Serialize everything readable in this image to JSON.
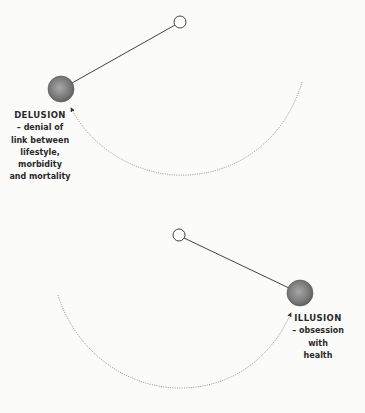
{
  "diagram": {
    "colors": {
      "background": "#fbfbfa",
      "ball_dark": "#5e5e5e",
      "ball_light": "#a8a8a8",
      "line": "#444444",
      "arc": "#8a8a8a",
      "text": "#2a2a2a"
    },
    "pendulums": [
      {
        "id": "delusion",
        "pivot": {
          "x": 180,
          "y": 22,
          "r": 6
        },
        "ball": {
          "x": 61,
          "y": 89,
          "r": 13
        },
        "swing_arc": {
          "start": [
            302,
            82
          ],
          "bottom": [
            180,
            175
          ],
          "end": [
            70,
            106
          ],
          "arrow_at": "end"
        },
        "label": {
          "title": "DELUSION",
          "lines": [
            "– denial of",
            "link between",
            "lifestyle,",
            "morbidity",
            "and mortality"
          ]
        }
      },
      {
        "id": "illusion",
        "pivot": {
          "x": 179,
          "y": 235,
          "r": 6
        },
        "ball": {
          "x": 300,
          "y": 293,
          "r": 13
        },
        "swing_arc": {
          "start": [
            58,
            295
          ],
          "bottom": [
            180,
            388
          ],
          "end": [
            292,
            311
          ],
          "arrow_at": "end"
        },
        "label": {
          "title": "ILLUSION",
          "lines": [
            "– obsession",
            "with",
            "health"
          ]
        }
      }
    ]
  }
}
